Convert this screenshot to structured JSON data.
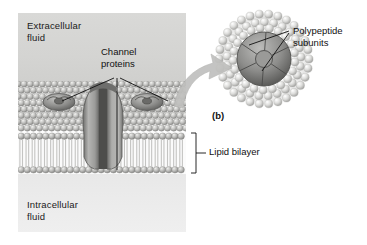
{
  "figure": {
    "panel_label": "(b)",
    "background_color": "#ffffff"
  },
  "membrane_panel": {
    "name": "plasma-membrane-cross-section",
    "extracellular_label": "Extracellular\nfluid",
    "intracellular_label": "Intracellular\nfluid",
    "extracellular_color": "#d6d6d4",
    "intracellular_color": "#ededed",
    "glycocalyx_color": "#b9b9b7",
    "bilayer_color": "#fbfbfb",
    "phospholipid_head_color": "#a9a9a7",
    "phospholipid_tail_color": "#c6c6c4"
  },
  "callouts": {
    "channel_proteins": {
      "label": "Channel\nproteins",
      "leader_count": 3
    },
    "lipid_bilayer": {
      "label": "Lipid bilayer",
      "bracket": true
    },
    "polypeptide_subunits": {
      "label": "Polypeptide\nsubunits",
      "leader_count": 2
    }
  },
  "proteins": {
    "left_surface_protein": "channel-protein-left",
    "right_surface_protein": "channel-protein-right",
    "transmembrane_channel": "channel-protein-transmembrane",
    "protein_color": "#8f8f8d"
  },
  "inset": {
    "name": "channel-protein-top-view",
    "magnify_arrow": "magnify-arrow",
    "subunit_count": 6,
    "bead_ring_color": "#d4d4d2",
    "subunit_color": "#8a8a88",
    "central_pore": "central-pore"
  }
}
